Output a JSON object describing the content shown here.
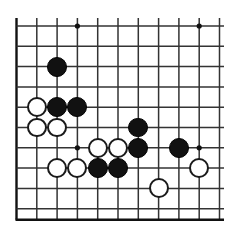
{
  "diagram": {
    "kind": "go-board-diagram",
    "board": {
      "columns_visible": 11,
      "rows_visible": 10,
      "cell_size": 20.3,
      "origin_x": 16.5,
      "origin_y": 26,
      "edges": {
        "left_border": true,
        "top_border": false,
        "right_border": false,
        "bottom_border": true
      },
      "line_color": "#333333",
      "border_color": "#111111",
      "background_color": "#ffffff"
    },
    "star_points": [
      {
        "col": 3,
        "row": 0
      },
      {
        "col": 9,
        "row": 0
      },
      {
        "col": 3,
        "row": 6
      },
      {
        "col": 9,
        "row": 6
      }
    ],
    "stones": [
      {
        "color": "black",
        "col": 2,
        "row": 2
      },
      {
        "color": "white",
        "col": 1,
        "row": 4
      },
      {
        "color": "black",
        "col": 2,
        "row": 4
      },
      {
        "color": "black",
        "col": 3,
        "row": 4
      },
      {
        "color": "white",
        "col": 1,
        "row": 5
      },
      {
        "color": "white",
        "col": 2,
        "row": 5
      },
      {
        "color": "black",
        "col": 6,
        "row": 5
      },
      {
        "color": "white",
        "col": 4,
        "row": 6
      },
      {
        "color": "white",
        "col": 5,
        "row": 6
      },
      {
        "color": "black",
        "col": 6,
        "row": 6
      },
      {
        "color": "black",
        "col": 8,
        "row": 6
      },
      {
        "color": "white",
        "col": 2,
        "row": 7
      },
      {
        "color": "white",
        "col": 3,
        "row": 7
      },
      {
        "color": "black",
        "col": 4,
        "row": 7
      },
      {
        "color": "black",
        "col": 5,
        "row": 7
      },
      {
        "color": "white",
        "col": 9,
        "row": 7
      },
      {
        "color": "white",
        "col": 7,
        "row": 8
      }
    ],
    "stone_counts": {
      "black_label": "Black",
      "black": 8,
      "white_label": "White",
      "white": 9
    },
    "colors": {
      "black_stone": "#111111",
      "white_stone": "#ffffff",
      "white_stone_outline": "#1a1a1a",
      "grid_line": "#333333"
    }
  }
}
